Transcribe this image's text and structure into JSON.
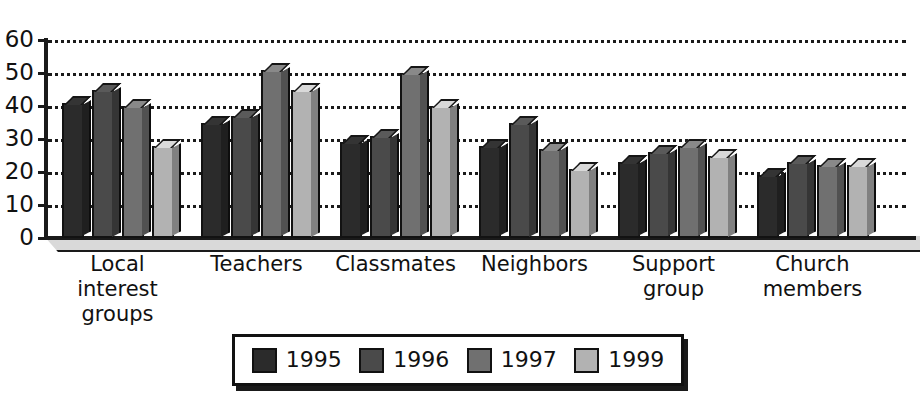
{
  "chart_data": {
    "type": "bar",
    "title": "",
    "subtitle": "",
    "xlabel": "",
    "ylabel": "",
    "ylim": [
      0,
      60
    ],
    "ytick_step": 10,
    "yticks": [
      0,
      10,
      20,
      30,
      40,
      50,
      60
    ],
    "grid": true,
    "grid_style": "dotted-horizontal",
    "legend_position": "bottom-center",
    "style": "3d-column",
    "categories": [
      "Local interest groups",
      "Teachers",
      "Classmates",
      "Neighbors",
      "Support group",
      "Church members"
    ],
    "category_lines": [
      [
        "Local interest",
        "groups"
      ],
      [
        "Teachers"
      ],
      [
        "Classmates"
      ],
      [
        "Neighbors"
      ],
      [
        "Support",
        "group"
      ],
      [
        "Church",
        "members"
      ]
    ],
    "series": [
      {
        "name": "1995",
        "color": "#2b2b2b",
        "values": [
          41,
          35,
          29,
          28,
          23,
          19
        ]
      },
      {
        "name": "1996",
        "color": "#4a4a4a",
        "values": [
          45,
          37,
          31,
          35,
          26,
          23
        ]
      },
      {
        "name": "1997",
        "color": "#707070",
        "values": [
          40,
          51,
          50,
          27,
          28,
          22
        ]
      },
      {
        "name": "1999",
        "color": "#b2b2b2",
        "values": [
          28,
          45,
          40,
          21,
          25,
          22
        ]
      }
    ]
  },
  "legend": {
    "items": [
      {
        "label": "1995",
        "color": "#2b2b2b"
      },
      {
        "label": "1996",
        "color": "#4a4a4a"
      },
      {
        "label": "1997",
        "color": "#707070"
      },
      {
        "label": "1999",
        "color": "#b2b2b2"
      }
    ]
  },
  "axis": {
    "y_tick_labels": [
      "60",
      "50",
      "40",
      "30",
      "20",
      "10",
      "0"
    ]
  },
  "colors": {
    "axis": "#1a1a1a",
    "grid": "#1a1a1a",
    "text": "#111111",
    "background": "#ffffff",
    "floor": "#d9d9d9"
  }
}
